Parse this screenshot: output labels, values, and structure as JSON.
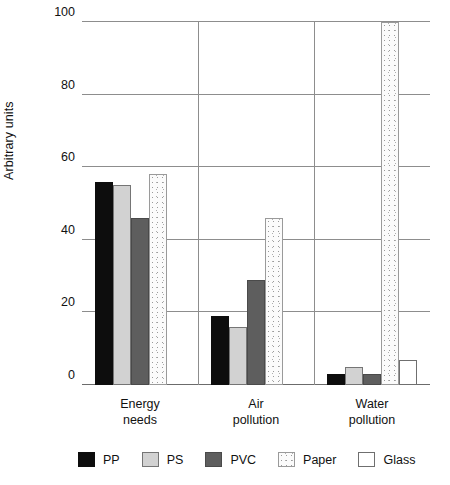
{
  "chart_data": {
    "type": "bar",
    "title": "",
    "xlabel": "",
    "ylabel": "Arbitrary units",
    "ylim": [
      0,
      100
    ],
    "yticks": [
      "0",
      "20",
      "40",
      "60",
      "80",
      "100"
    ],
    "grid": true,
    "legend_position": "bottom",
    "categories": [
      "Energy needs",
      "Air pollution",
      "Water pollution"
    ],
    "category_lines": [
      [
        "Energy",
        "needs"
      ],
      [
        "Air",
        "pollution"
      ],
      [
        "Water",
        "pollution"
      ]
    ],
    "series": [
      {
        "name": "PP",
        "color": "#0d0d0d",
        "values": [
          56,
          19,
          3
        ]
      },
      {
        "name": "PS",
        "color": "#d2d2d2",
        "values": [
          55,
          16,
          5
        ]
      },
      {
        "name": "PVC",
        "color": "#5e5e5e",
        "values": [
          46,
          29,
          3
        ]
      },
      {
        "name": "Paper",
        "color": "#fbfbfb",
        "values": [
          58,
          46,
          100
        ]
      },
      {
        "name": "Glass",
        "color": "#ffffff",
        "values": [
          0,
          0,
          7
        ]
      }
    ]
  },
  "legend": {
    "items": [
      {
        "label": "PP"
      },
      {
        "label": "PS"
      },
      {
        "label": "PVC"
      },
      {
        "label": "Paper"
      },
      {
        "label": "Glass"
      }
    ]
  }
}
